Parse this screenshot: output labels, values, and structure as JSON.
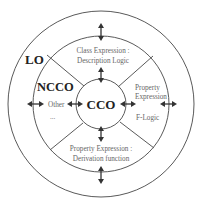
{
  "diagram": {
    "layers": {
      "outer": {
        "label": "LO"
      },
      "middle": {
        "label": "NCCO"
      },
      "inner": {
        "label": "CCO"
      }
    },
    "sectors": {
      "top": {
        "line1": "Class Expression :",
        "line2": "Description Logic"
      },
      "right": {
        "line1": "Property",
        "line2": "Expression",
        "line3": "F-Logic"
      },
      "bottom": {
        "line1": "Property Expression :",
        "line2": "Derivation function"
      },
      "left": {
        "line1": "Other",
        "line2": "..."
      }
    },
    "colors": {
      "lines": "#5a5a5a",
      "arrows": "#333333",
      "primary_text": "#222222",
      "secondary_text": "#666666"
    }
  }
}
